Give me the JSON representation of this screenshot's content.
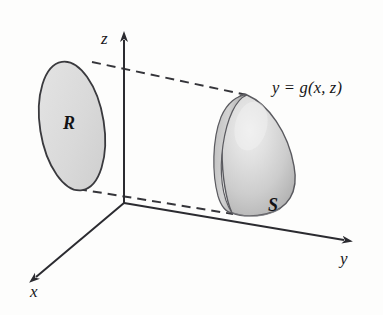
{
  "figure": {
    "kind": "3d-coordinate-diagram",
    "background_color": "#fdfdfc",
    "stroke_color": "#2b2b30",
    "axes": [
      {
        "name": "x",
        "label": "x",
        "direction": "down-left",
        "arrow": true
      },
      {
        "name": "y",
        "label": "y",
        "direction": "right",
        "arrow": true
      },
      {
        "name": "z",
        "label": "z",
        "direction": "up",
        "arrow": true
      }
    ],
    "labels": {
      "x_axis": "x",
      "y_axis": "y",
      "z_axis": "z",
      "region": "R",
      "surface": "S",
      "surface_equation": "y = g(x, z)"
    },
    "shapes": [
      {
        "name": "region-R",
        "type": "ellipse",
        "label": "R",
        "fill_color": "#dcdcdc",
        "stroke_color": "#39393d",
        "description": "tilted flat elliptical region in the xz-plane"
      },
      {
        "name": "surface-S",
        "type": "curved-surface",
        "label": "S",
        "fill_color": "#cfcfcf",
        "highlight_color": "#eeeeee",
        "shadow_color": "#a8a8a8",
        "stroke_color": "#55555a",
        "description": "shaded three dimensional dome surface given by y = g(x, z)"
      }
    ],
    "connectors": [
      {
        "name": "top-projection-line",
        "style": "dashed",
        "from": "region-R-top",
        "to": "surface-S-top"
      },
      {
        "name": "bottom-projection-line",
        "style": "dashed",
        "from": "region-R-bottom",
        "to": "surface-S-bottom"
      }
    ]
  }
}
